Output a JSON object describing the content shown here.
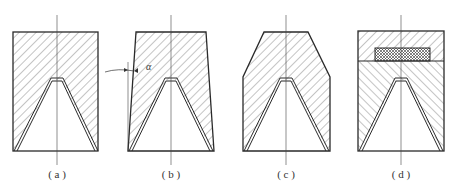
{
  "figure": {
    "panels": [
      {
        "id": "a",
        "label": "( a )",
        "shape": "rectangle"
      },
      {
        "id": "b",
        "label": "( b )",
        "shape": "tapered trapezoid",
        "annotation": "α"
      },
      {
        "id": "c",
        "label": "( c )",
        "shape": "chamfered top"
      },
      {
        "id": "d",
        "label": "( d )",
        "shape": "rectangle with cross-hatched insert"
      }
    ],
    "colors": {
      "line": "#2a2a2a",
      "hatch": "#555555",
      "background": "#ffffff"
    }
  }
}
